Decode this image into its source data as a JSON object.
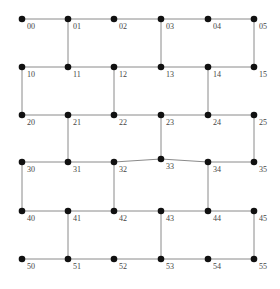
{
  "diagram": {
    "type": "grid-graph",
    "colors": {
      "edge": "#8a8a8a",
      "node": "#111111",
      "label": "#444444"
    },
    "col_x": [
      22,
      68,
      114,
      161,
      208,
      254
    ],
    "row_y": [
      19,
      67,
      115,
      162,
      211,
      259
    ],
    "nodes": [
      {
        "id": "00",
        "r": 0,
        "c": 0
      },
      {
        "id": "01",
        "r": 0,
        "c": 1
      },
      {
        "id": "02",
        "r": 0,
        "c": 2
      },
      {
        "id": "03",
        "r": 0,
        "c": 3
      },
      {
        "id": "04",
        "r": 0,
        "c": 4
      },
      {
        "id": "05",
        "r": 0,
        "c": 5
      },
      {
        "id": "10",
        "r": 1,
        "c": 0
      },
      {
        "id": "11",
        "r": 1,
        "c": 1
      },
      {
        "id": "12",
        "r": 1,
        "c": 2
      },
      {
        "id": "13",
        "r": 1,
        "c": 3
      },
      {
        "id": "14",
        "r": 1,
        "c": 4
      },
      {
        "id": "15",
        "r": 1,
        "c": 5
      },
      {
        "id": "20",
        "r": 2,
        "c": 0
      },
      {
        "id": "21",
        "r": 2,
        "c": 1
      },
      {
        "id": "22",
        "r": 2,
        "c": 2
      },
      {
        "id": "23",
        "r": 2,
        "c": 3
      },
      {
        "id": "24",
        "r": 2,
        "c": 4
      },
      {
        "id": "25",
        "r": 2,
        "c": 5
      },
      {
        "id": "30",
        "r": 3,
        "c": 0
      },
      {
        "id": "31",
        "r": 3,
        "c": 1
      },
      {
        "id": "32",
        "r": 3,
        "c": 2
      },
      {
        "id": "33",
        "r": 3,
        "c": 3,
        "dy": -3
      },
      {
        "id": "34",
        "r": 3,
        "c": 4
      },
      {
        "id": "35",
        "r": 3,
        "c": 5
      },
      {
        "id": "40",
        "r": 4,
        "c": 0
      },
      {
        "id": "41",
        "r": 4,
        "c": 1
      },
      {
        "id": "42",
        "r": 4,
        "c": 2
      },
      {
        "id": "43",
        "r": 4,
        "c": 3
      },
      {
        "id": "44",
        "r": 4,
        "c": 4
      },
      {
        "id": "45",
        "r": 4,
        "c": 5
      },
      {
        "id": "50",
        "r": 5,
        "c": 0
      },
      {
        "id": "51",
        "r": 5,
        "c": 1
      },
      {
        "id": "52",
        "r": 5,
        "c": 2
      },
      {
        "id": "53",
        "r": 5,
        "c": 3
      },
      {
        "id": "54",
        "r": 5,
        "c": 4
      },
      {
        "id": "55",
        "r": 5,
        "c": 5
      }
    ],
    "edges": [
      [
        "00",
        "01"
      ],
      [
        "01",
        "02"
      ],
      [
        "02",
        "03"
      ],
      [
        "03",
        "04"
      ],
      [
        "04",
        "05"
      ],
      [
        "10",
        "11"
      ],
      [
        "11",
        "12"
      ],
      [
        "12",
        "13"
      ],
      [
        "13",
        "14"
      ],
      [
        "14",
        "15"
      ],
      [
        "20",
        "21"
      ],
      [
        "21",
        "22"
      ],
      [
        "22",
        "23"
      ],
      [
        "23",
        "24"
      ],
      [
        "24",
        "25"
      ],
      [
        "30",
        "31"
      ],
      [
        "31",
        "32"
      ],
      [
        "32",
        "33"
      ],
      [
        "33",
        "34"
      ],
      [
        "34",
        "35"
      ],
      [
        "40",
        "41"
      ],
      [
        "41",
        "42"
      ],
      [
        "42",
        "43"
      ],
      [
        "43",
        "44"
      ],
      [
        "44",
        "45"
      ],
      [
        "50",
        "51"
      ],
      [
        "51",
        "52"
      ],
      [
        "52",
        "53"
      ],
      [
        "53",
        "54"
      ],
      [
        "54",
        "55"
      ],
      [
        "01",
        "11"
      ],
      [
        "03",
        "13"
      ],
      [
        "05",
        "15"
      ],
      [
        "10",
        "20"
      ],
      [
        "12",
        "22"
      ],
      [
        "14",
        "24"
      ],
      [
        "21",
        "31"
      ],
      [
        "23",
        "33"
      ],
      [
        "25",
        "35"
      ],
      [
        "30",
        "40"
      ],
      [
        "32",
        "42"
      ],
      [
        "34",
        "44"
      ],
      [
        "41",
        "51"
      ],
      [
        "43",
        "53"
      ],
      [
        "45",
        "55"
      ]
    ]
  }
}
